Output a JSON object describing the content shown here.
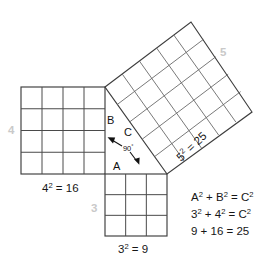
{
  "diagram": {
    "background_color": "#ffffff",
    "line_color": "#3d3d3d",
    "grid_color": "#6a6a6a",
    "side_label_color": "#c9c9c9",
    "text_color": "#161616"
  },
  "squares": {
    "leg_b": {
      "side_label": "4",
      "area_label_parts": {
        "base": "4",
        "exponent": "2",
        "equals": " = 16"
      },
      "area_label_text": "4² = 16",
      "grid_divisions": 4,
      "cell_count": 16
    },
    "leg_a": {
      "side_label": "3",
      "area_label_parts": {
        "base": "3",
        "exponent": "2",
        "equals": " = 9"
      },
      "area_label_text": "3² = 9",
      "grid_divisions": 3,
      "cell_count": 9
    },
    "hypotenuse_c": {
      "side_label": "5",
      "area_label_parts": {
        "base": "5",
        "exponent": "2",
        "equals": " = 25"
      },
      "area_label_text": "5² = 25",
      "grid_divisions": 5,
      "cell_count": 25
    }
  },
  "triangle": {
    "vertex_labels": {
      "a": "A",
      "b": "B",
      "c": "C"
    },
    "angle": {
      "value": "90",
      "degree_symbol": "°",
      "text": "90°"
    }
  },
  "equations": {
    "lines": [
      {
        "id": "general-form",
        "text": "A² + B² = C²",
        "segments": [
          {
            "base": "A",
            "sup": "2"
          },
          {
            "base": " + ",
            "sup": ""
          },
          {
            "base": "B",
            "sup": "2"
          },
          {
            "base": " = ",
            "sup": ""
          },
          {
            "base": "C",
            "sup": "2"
          }
        ]
      },
      {
        "id": "substituted-form",
        "text": "3² + 4² = C²",
        "segments": [
          {
            "base": "3",
            "sup": "2"
          },
          {
            "base": " + ",
            "sup": ""
          },
          {
            "base": "4",
            "sup": "2"
          },
          {
            "base": " = ",
            "sup": ""
          },
          {
            "base": "C",
            "sup": "2"
          }
        ]
      },
      {
        "id": "evaluated-form",
        "text": "9 + 16  = 25",
        "segments": [
          {
            "base": "9 + 16  = 25",
            "sup": ""
          }
        ]
      }
    ]
  }
}
